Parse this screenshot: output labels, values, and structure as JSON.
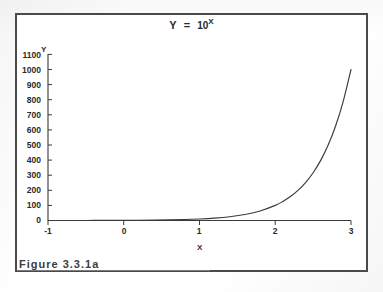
{
  "figure": {
    "caption": "Figure 3.3.1a",
    "border_color": "#4a4a4a",
    "background_color": "#ffffff"
  },
  "title": {
    "lhs": "Y",
    "equals": "=",
    "base": "10",
    "exponent": "X",
    "full_text": "Y = 10X"
  },
  "axes": {
    "y_axis_title": "Y",
    "x_axis_title": "X"
  },
  "chart_data": {
    "type": "line",
    "xlabel": "X",
    "ylabel": "Y",
    "xlim": [
      -1,
      3
    ],
    "ylim": [
      0,
      1100
    ],
    "grid": false,
    "legend": null,
    "x_ticks": [
      -1,
      0,
      1,
      2,
      3
    ],
    "x_tick_labels": [
      "-1",
      "0",
      "1",
      "2",
      "3"
    ],
    "y_ticks": [
      0,
      100,
      200,
      300,
      400,
      500,
      600,
      700,
      800,
      900,
      1000,
      1100
    ],
    "y_tick_labels": [
      "0",
      "100",
      "200",
      "300",
      "400",
      "500",
      "600",
      "700",
      "800",
      "900",
      "1000",
      "1100"
    ],
    "series": [
      {
        "name": "Y = 10^X",
        "color": "#3a3a3a",
        "line_width": 1,
        "x": [
          -1.0,
          -0.8,
          -0.6,
          -0.4,
          -0.2,
          0.0,
          0.2,
          0.4,
          0.6,
          0.8,
          1.0,
          1.2,
          1.4,
          1.6,
          1.8,
          2.0,
          2.1,
          2.2,
          2.3,
          2.4,
          2.5,
          2.6,
          2.7,
          2.8,
          2.9,
          3.0
        ],
        "y": [
          0.1,
          0.16,
          0.25,
          0.4,
          0.63,
          1.0,
          1.58,
          2.51,
          3.98,
          6.31,
          10.0,
          15.85,
          25.12,
          39.81,
          63.1,
          100.0,
          125.9,
          158.5,
          199.5,
          251.2,
          316.2,
          398.1,
          501.2,
          631.0,
          794.3,
          1000.0
        ]
      }
    ]
  }
}
